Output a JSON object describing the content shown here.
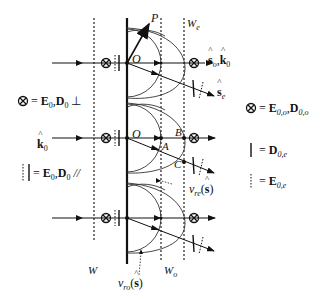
{
  "diagram": {
    "labels": {
      "P": "P",
      "O_top": "O",
      "O_mid": "O",
      "A": "A",
      "B": "B",
      "C": "C",
      "W": "W",
      "Wo_main": "W",
      "Wo_sub": "o",
      "We_main": "W",
      "We_sub": "e",
      "so_k0": {
        "s": "s",
        "s_sub": "o",
        "sep": ",",
        "k": "k",
        "k_sub": "0"
      },
      "se": {
        "s": "s",
        "s_sub": "e"
      },
      "k0": {
        "k": "k",
        "k_sub": "0"
      },
      "vre": {
        "v": "v",
        "v_sub": "re",
        "open": "(",
        "s": "s",
        "close": ")"
      },
      "vro": {
        "v": "v",
        "v_sub": "ro",
        "open": "(",
        "s": "s",
        "close": ")"
      }
    },
    "legend_left": [
      {
        "symbol": "otimes",
        "text": "= ",
        "E": "E",
        "E_sub": "0",
        "sep": ",",
        "D": "D",
        "D_sub": "0",
        "mark": " ⊥"
      },
      {
        "symbol": "dotted-solid-bars",
        "text": "= ",
        "E": "E",
        "E_sub": "0",
        "sep": ",",
        "D": "D",
        "D_sub": "0",
        "mark": " //"
      }
    ],
    "legend_right": [
      {
        "symbol": "otimes",
        "text": "= ",
        "E": "E",
        "E_sub": "0,o",
        "sep": ",",
        "D": "D",
        "D_sub": "0,o"
      },
      {
        "symbol": "solid-bar",
        "text": "= ",
        "D": "D",
        "D_sub": "0,e"
      },
      {
        "symbol": "dotted-bar",
        "text": "= ",
        "E": "E",
        "E_sub": "0,e"
      }
    ],
    "colors": {
      "line": "#111111",
      "background": "#ffffff"
    }
  }
}
